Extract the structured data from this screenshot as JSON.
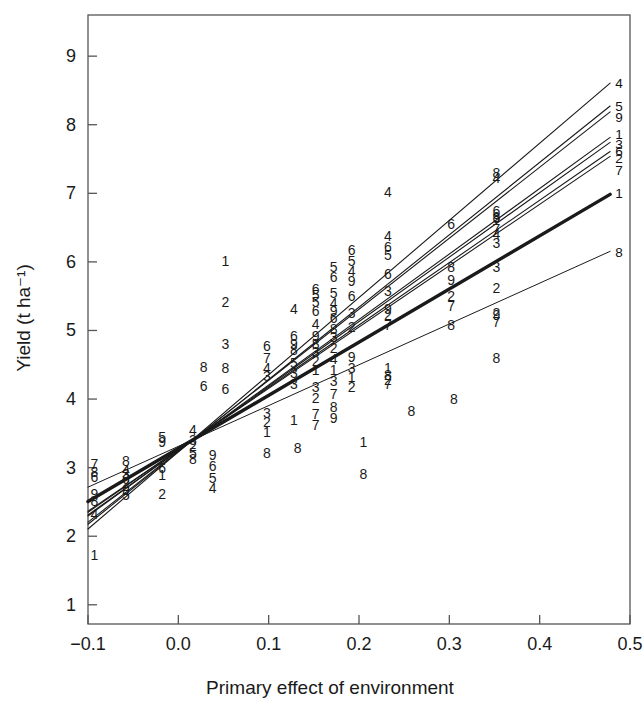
{
  "figure": {
    "kind": "scatter-with-regression-lines",
    "background_color": "#ffffff",
    "frame_color": "#555555",
    "ink_color": "#1a1a1a"
  },
  "chart_data": {
    "type": "scatter",
    "title": "",
    "subtitle": "",
    "xlabel": "Primary effect of environment",
    "ylabel": "Yield (t ha⁻¹)",
    "xlim": [
      -0.1,
      0.5
    ],
    "ylim": [
      0.72,
      9.6
    ],
    "xticks": [
      -0.1,
      0.0,
      0.1,
      0.2,
      0.3,
      0.4,
      0.5
    ],
    "xticklabels": [
      "−0.1",
      "0.0",
      "0.1",
      "0.2",
      "0.3",
      "0.4",
      "0.5"
    ],
    "yticks": [
      1,
      2,
      3,
      4,
      5,
      6,
      7,
      8,
      9
    ],
    "yticklabels": [
      "1",
      "2",
      "3",
      "4",
      "5",
      "6",
      "7",
      "8",
      "9"
    ],
    "grid": false,
    "legend": "none",
    "marker_style": "genotype-number-glyph",
    "genotypes": [
      "1",
      "2",
      "3",
      "4",
      "5",
      "6",
      "7",
      "8",
      "9"
    ],
    "convergence_point": {
      "x": 0.016,
      "y": 3.4
    },
    "series": [
      {
        "name": "1",
        "label": "1",
        "slope": 7.75,
        "intercept": 3.28,
        "x_end": 0.478,
        "y_end": 6.99,
        "weight": 3.4
      },
      {
        "name": "2",
        "label": "2",
        "slope": 9.1,
        "intercept": 3.26,
        "x_end": 0.478,
        "y_end": 7.61,
        "weight": 1.1
      },
      {
        "name": "3",
        "label": "3",
        "slope": 9.4,
        "intercept": 3.25,
        "x_end": 0.478,
        "y_end": 7.74,
        "weight": 1.1
      },
      {
        "name": "4",
        "label": "4",
        "slope": 11.25,
        "intercept": 3.23,
        "x_end": 0.478,
        "y_end": 8.61,
        "weight": 1.1
      },
      {
        "name": "5",
        "label": "5",
        "slope": 10.55,
        "intercept": 3.23,
        "x_end": 0.478,
        "y_end": 8.27,
        "weight": 1.1
      },
      {
        "name": "6",
        "label": "6",
        "slope": 9.55,
        "intercept": 3.25,
        "x_end": 0.478,
        "y_end": 7.81,
        "weight": 1.1
      },
      {
        "name": "7",
        "label": "7",
        "slope": 8.95,
        "intercept": 3.26,
        "x_end": 0.478,
        "y_end": 7.54,
        "weight": 1.1
      },
      {
        "name": "8",
        "label": "8",
        "slope": 5.95,
        "intercept": 3.31,
        "x_end": 0.478,
        "y_end": 6.15,
        "weight": 1.0
      },
      {
        "name": "9",
        "label": "9",
        "slope": 10.35,
        "intercept": 3.24,
        "x_end": 0.478,
        "y_end": 8.19,
        "weight": 1.1
      }
    ],
    "line_end_labels": [
      {
        "label": "4",
        "x": 0.478,
        "y": 8.61
      },
      {
        "label": "5",
        "x": 0.478,
        "y": 8.27
      },
      {
        "label": "9",
        "x": 0.478,
        "y": 8.11
      },
      {
        "label": "1",
        "x": 0.478,
        "y": 7.86
      },
      {
        "label": "3",
        "x": 0.478,
        "y": 7.72
      },
      {
        "label": "6",
        "x": 0.478,
        "y": 7.62
      },
      {
        "label": "2",
        "x": 0.478,
        "y": 7.52
      },
      {
        "label": "7",
        "x": 0.478,
        "y": 7.34
      },
      {
        "label": "1",
        "x": 0.478,
        "y": 7.0
      },
      {
        "label": "8",
        "x": 0.478,
        "y": 6.14
      }
    ],
    "points": [
      {
        "g": "7",
        "x": -0.093,
        "y": 3.05
      },
      {
        "g": "8",
        "x": -0.093,
        "y": 2.93
      },
      {
        "g": "6",
        "x": -0.093,
        "y": 2.87
      },
      {
        "g": "9",
        "x": -0.093,
        "y": 2.62
      },
      {
        "g": "8",
        "x": -0.093,
        "y": 2.52
      },
      {
        "g": "4",
        "x": -0.093,
        "y": 2.32
      },
      {
        "g": "1",
        "x": -0.093,
        "y": 1.72
      },
      {
        "g": "8",
        "x": -0.058,
        "y": 3.09
      },
      {
        "g": "4",
        "x": -0.058,
        "y": 2.97
      },
      {
        "g": "3",
        "x": -0.058,
        "y": 2.9
      },
      {
        "g": "6",
        "x": -0.058,
        "y": 2.84
      },
      {
        "g": "2",
        "x": -0.058,
        "y": 2.78
      },
      {
        "g": "9",
        "x": -0.058,
        "y": 2.68
      },
      {
        "g": "5",
        "x": -0.058,
        "y": 2.6
      },
      {
        "g": "5",
        "x": -0.018,
        "y": 3.45
      },
      {
        "g": "9",
        "x": -0.018,
        "y": 3.37
      },
      {
        "g": "6",
        "x": -0.018,
        "y": 2.99
      },
      {
        "g": "1",
        "x": -0.018,
        "y": 2.89
      },
      {
        "g": "2",
        "x": -0.018,
        "y": 2.62
      },
      {
        "g": "4",
        "x": 0.016,
        "y": 3.55
      },
      {
        "g": "3",
        "x": 0.016,
        "y": 3.4
      },
      {
        "g": "2",
        "x": 0.016,
        "y": 3.31
      },
      {
        "g": "5",
        "x": 0.016,
        "y": 3.22
      },
      {
        "g": "8",
        "x": 0.016,
        "y": 3.12
      },
      {
        "g": "9",
        "x": 0.038,
        "y": 3.18
      },
      {
        "g": "6",
        "x": 0.038,
        "y": 3.02
      },
      {
        "g": "5",
        "x": 0.038,
        "y": 2.85
      },
      {
        "g": "4",
        "x": 0.038,
        "y": 2.7
      },
      {
        "g": "1",
        "x": 0.052,
        "y": 6.02
      },
      {
        "g": "2",
        "x": 0.052,
        "y": 5.42
      },
      {
        "g": "3",
        "x": 0.052,
        "y": 4.81
      },
      {
        "g": "8",
        "x": 0.052,
        "y": 4.45
      },
      {
        "g": "6",
        "x": 0.052,
        "y": 4.14
      },
      {
        "g": "8",
        "x": 0.028,
        "y": 4.47
      },
      {
        "g": "6",
        "x": 0.028,
        "y": 4.19
      },
      {
        "g": "6",
        "x": 0.098,
        "y": 4.78
      },
      {
        "g": "7",
        "x": 0.098,
        "y": 4.6
      },
      {
        "g": "4",
        "x": 0.098,
        "y": 4.46
      },
      {
        "g": "3",
        "x": 0.098,
        "y": 4.33
      },
      {
        "g": "3",
        "x": 0.098,
        "y": 3.8
      },
      {
        "g": "2",
        "x": 0.098,
        "y": 3.66
      },
      {
        "g": "1",
        "x": 0.098,
        "y": 3.52
      },
      {
        "g": "8",
        "x": 0.098,
        "y": 3.22
      },
      {
        "g": "4",
        "x": 0.128,
        "y": 5.32
      },
      {
        "g": "6",
        "x": 0.128,
        "y": 4.92
      },
      {
        "g": "9",
        "x": 0.128,
        "y": 4.8
      },
      {
        "g": "8",
        "x": 0.128,
        "y": 4.72
      },
      {
        "g": "5",
        "x": 0.128,
        "y": 4.52
      },
      {
        "g": "3",
        "x": 0.128,
        "y": 4.38
      },
      {
        "g": "3",
        "x": 0.128,
        "y": 4.22
      },
      {
        "g": "1",
        "x": 0.128,
        "y": 3.7
      },
      {
        "g": "6",
        "x": 0.152,
        "y": 5.6
      },
      {
        "g": "5",
        "x": 0.152,
        "y": 5.52
      },
      {
        "g": "5",
        "x": 0.152,
        "y": 5.42
      },
      {
        "g": "6",
        "x": 0.152,
        "y": 5.28
      },
      {
        "g": "4",
        "x": 0.152,
        "y": 5.1
      },
      {
        "g": "9",
        "x": 0.152,
        "y": 4.92
      },
      {
        "g": "8",
        "x": 0.152,
        "y": 4.8
      },
      {
        "g": "3",
        "x": 0.152,
        "y": 4.68
      },
      {
        "g": "2",
        "x": 0.152,
        "y": 4.55
      },
      {
        "g": "1",
        "x": 0.152,
        "y": 4.42
      },
      {
        "g": "3",
        "x": 0.152,
        "y": 4.18
      },
      {
        "g": "2",
        "x": 0.152,
        "y": 4.02
      },
      {
        "g": "7",
        "x": 0.152,
        "y": 3.78
      },
      {
        "g": "7",
        "x": 0.152,
        "y": 3.62
      },
      {
        "g": "5",
        "x": 0.172,
        "y": 5.92
      },
      {
        "g": "6",
        "x": 0.172,
        "y": 5.78
      },
      {
        "g": "5",
        "x": 0.172,
        "y": 5.55
      },
      {
        "g": "4",
        "x": 0.172,
        "y": 5.4
      },
      {
        "g": "9",
        "x": 0.172,
        "y": 5.28
      },
      {
        "g": "6",
        "x": 0.172,
        "y": 5.18
      },
      {
        "g": "8",
        "x": 0.172,
        "y": 5.02
      },
      {
        "g": "3",
        "x": 0.172,
        "y": 4.9
      },
      {
        "g": "2",
        "x": 0.172,
        "y": 4.74
      },
      {
        "g": "4",
        "x": 0.172,
        "y": 4.58
      },
      {
        "g": "1",
        "x": 0.172,
        "y": 4.42
      },
      {
        "g": "3",
        "x": 0.172,
        "y": 4.26
      },
      {
        "g": "7",
        "x": 0.172,
        "y": 4.08
      },
      {
        "g": "8",
        "x": 0.172,
        "y": 3.88
      },
      {
        "g": "9",
        "x": 0.172,
        "y": 3.72
      },
      {
        "g": "6",
        "x": 0.192,
        "y": 6.18
      },
      {
        "g": "5",
        "x": 0.192,
        "y": 6.02
      },
      {
        "g": "4",
        "x": 0.192,
        "y": 5.86
      },
      {
        "g": "9",
        "x": 0.192,
        "y": 5.72
      },
      {
        "g": "6",
        "x": 0.192,
        "y": 5.5
      },
      {
        "g": "3",
        "x": 0.192,
        "y": 5.26
      },
      {
        "g": "2",
        "x": 0.192,
        "y": 5.05
      },
      {
        "g": "9",
        "x": 0.192,
        "y": 4.62
      },
      {
        "g": "3",
        "x": 0.192,
        "y": 4.46
      },
      {
        "g": "1",
        "x": 0.192,
        "y": 4.32
      },
      {
        "g": "2",
        "x": 0.192,
        "y": 4.18
      },
      {
        "g": "4",
        "x": 0.232,
        "y": 7.02
      },
      {
        "g": "4",
        "x": 0.232,
        "y": 6.38
      },
      {
        "g": "6",
        "x": 0.232,
        "y": 6.22
      },
      {
        "g": "5",
        "x": 0.232,
        "y": 6.1
      },
      {
        "g": "6",
        "x": 0.232,
        "y": 5.82
      },
      {
        "g": "3",
        "x": 0.232,
        "y": 5.58
      },
      {
        "g": "9",
        "x": 0.232,
        "y": 5.32
      },
      {
        "g": "2",
        "x": 0.232,
        "y": 5.22
      },
      {
        "g": "7",
        "x": 0.232,
        "y": 5.08
      },
      {
        "g": "1",
        "x": 0.232,
        "y": 4.46
      },
      {
        "g": "8",
        "x": 0.232,
        "y": 4.35
      },
      {
        "g": "2",
        "x": 0.232,
        "y": 4.28
      },
      {
        "g": "7",
        "x": 0.232,
        "y": 4.22
      },
      {
        "g": "8",
        "x": 0.132,
        "y": 3.28
      },
      {
        "g": "1",
        "x": 0.205,
        "y": 3.38
      },
      {
        "g": "8",
        "x": 0.205,
        "y": 2.9
      },
      {
        "g": "8",
        "x": 0.258,
        "y": 3.82
      },
      {
        "g": "6",
        "x": 0.302,
        "y": 6.55
      },
      {
        "g": "8",
        "x": 0.302,
        "y": 5.92
      },
      {
        "g": "9",
        "x": 0.302,
        "y": 5.74
      },
      {
        "g": "2",
        "x": 0.302,
        "y": 5.5
      },
      {
        "g": "7",
        "x": 0.302,
        "y": 5.36
      },
      {
        "g": "8",
        "x": 0.302,
        "y": 5.08
      },
      {
        "g": "8",
        "x": 0.352,
        "y": 7.3
      },
      {
        "g": "4",
        "x": 0.352,
        "y": 7.22
      },
      {
        "g": "6",
        "x": 0.352,
        "y": 6.74
      },
      {
        "g": "8",
        "x": 0.352,
        "y": 6.66
      },
      {
        "g": "9",
        "x": 0.352,
        "y": 6.64
      },
      {
        "g": "7",
        "x": 0.352,
        "y": 6.48
      },
      {
        "g": "4",
        "x": 0.352,
        "y": 6.4
      },
      {
        "g": "3",
        "x": 0.352,
        "y": 6.28
      },
      {
        "g": "3",
        "x": 0.352,
        "y": 5.92
      },
      {
        "g": "2",
        "x": 0.352,
        "y": 5.62
      },
      {
        "g": "9",
        "x": 0.352,
        "y": 5.22
      },
      {
        "g": "2",
        "x": 0.352,
        "y": 5.25
      },
      {
        "g": "7",
        "x": 0.352,
        "y": 5.12
      },
      {
        "g": "8",
        "x": 0.352,
        "y": 4.6
      },
      {
        "g": "8",
        "x": 0.305,
        "y": 4.0
      }
    ]
  }
}
